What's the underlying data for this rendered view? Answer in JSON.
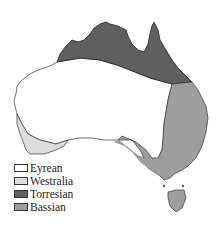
{
  "map": {
    "title": "Australian biogeographic regions",
    "colors": {
      "eyrean": "#ffffff",
      "westralia": "#dcdcdc",
      "torresian": "#5f5f5f",
      "bassian": "#9e9e9e",
      "outline": "#333333"
    }
  },
  "legend": {
    "items": [
      {
        "label": "Eyrean",
        "color": "#ffffff"
      },
      {
        "label": "Westralia",
        "color": "#dcdcdc"
      },
      {
        "label": "Torresian",
        "color": "#5f5f5f"
      },
      {
        "label": "Bassian",
        "color": "#9e9e9e"
      }
    ]
  }
}
